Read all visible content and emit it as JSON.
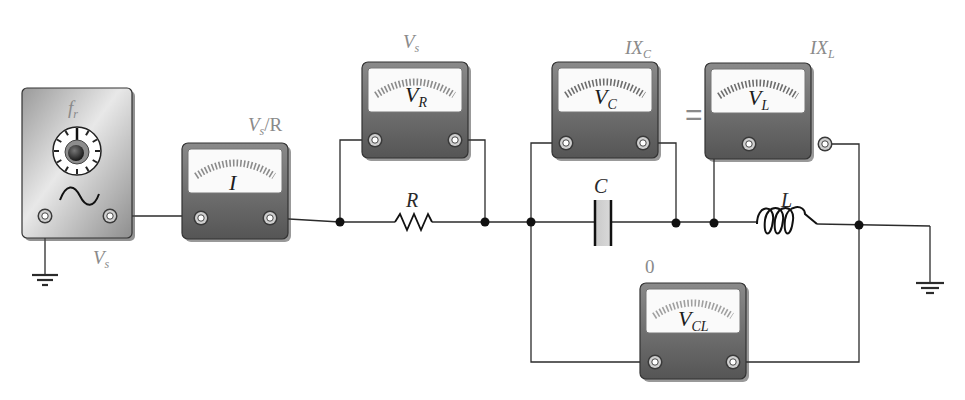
{
  "diagram": {
    "type": "series RLC circuit at resonance with voltmeter readings",
    "colors": {
      "wire": "#2b2b2b",
      "meter_body": "#6e6e6e",
      "meter_face": "#fafafa",
      "scale_ticks": "#8c8c8c",
      "label_gray": "#8a8a8a",
      "node": "#111111"
    },
    "generator": {
      "freq_label": "f",
      "freq_sub": "r",
      "source_label": "V",
      "source_sub": "s",
      "wave_icon": "sine-wave"
    },
    "meters": [
      {
        "id": "current",
        "face_label": "I",
        "face_sub": "",
        "reading": "V",
        "reading_sub": "s",
        "reading_suffix": "/R"
      },
      {
        "id": "resistor",
        "face_label": "V",
        "face_sub": "R",
        "reading": "V",
        "reading_sub": "s",
        "reading_suffix": ""
      },
      {
        "id": "capacitor",
        "face_label": "V",
        "face_sub": "C",
        "reading": "IX",
        "reading_sub": "C",
        "reading_suffix": ""
      },
      {
        "id": "inductor",
        "face_label": "V",
        "face_sub": "L",
        "reading": "IX",
        "reading_sub": "L",
        "reading_suffix": ""
      },
      {
        "id": "cap-ind",
        "face_label": "V",
        "face_sub": "CL",
        "reading": "0",
        "reading_sub": "",
        "reading_suffix": ""
      }
    ],
    "components": {
      "resistor": "R",
      "capacitor": "C",
      "inductor": "L"
    },
    "equals_sign": "="
  }
}
